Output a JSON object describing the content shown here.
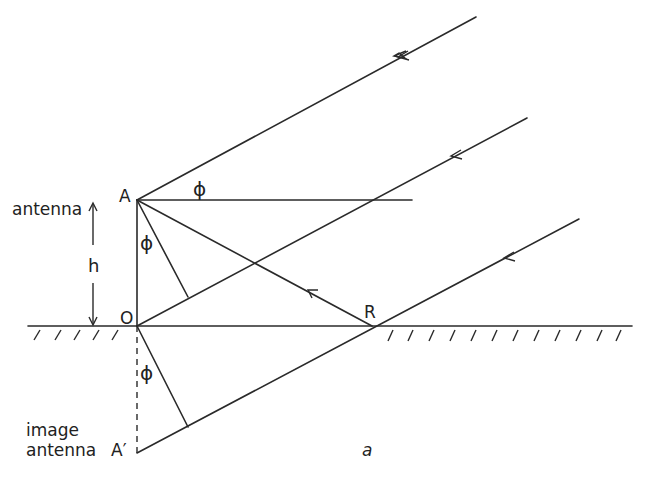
{
  "figure": {
    "type": "ground-reflection geometry diagram",
    "sub_label": "a"
  },
  "labels": {
    "antenna": "antenna",
    "point_A": "A",
    "point_O": "O",
    "point_R": "R",
    "height": "h",
    "phi_top": "ϕ",
    "phi_mid": "ϕ",
    "phi_low": "ϕ",
    "image_line1": "image",
    "image_line2": "antenna",
    "point_A_prime": "A′",
    "sub_label": "a"
  },
  "geometry": {
    "A": [
      137,
      200
    ],
    "O": [
      137,
      326
    ],
    "R": [
      372,
      326
    ],
    "A_prime": [
      137,
      453
    ],
    "ground_y": 326,
    "ground_x": [
      28,
      632
    ],
    "incoming_rays": [
      {
        "from": [
          476,
          17
        ],
        "to": [
          137,
          200
        ],
        "arrow_at": [
          402,
          57
        ]
      },
      {
        "from": [
          527,
          118
        ],
        "to": [
          137,
          326
        ],
        "arrow_at": [
          455,
          155
        ]
      },
      {
        "from": [
          579,
          219
        ],
        "to": [
          137,
          453
        ],
        "arrow_at": [
          508,
          257
        ]
      }
    ],
    "horizontal_from_A_to_x": 412,
    "perp_feet": [
      [
        188,
        297
      ],
      [
        188,
        427
      ]
    ],
    "reflected_ray": {
      "from": [
        372,
        326
      ],
      "to": [
        137,
        200
      ],
      "arrow_at": [
        313,
        294
      ]
    }
  },
  "colors": {
    "line": "#2a2a2a",
    "background": "#ffffff"
  }
}
